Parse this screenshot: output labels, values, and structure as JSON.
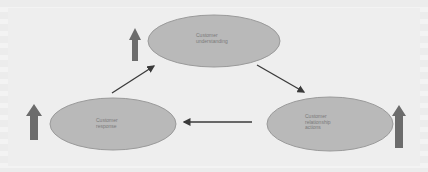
{
  "diagram": {
    "type": "cycle",
    "nodes": [
      {
        "id": "understanding",
        "label": "Customer\nunderstanding"
      },
      {
        "id": "response",
        "label": "Customer\nresponse"
      },
      {
        "id": "actions",
        "label": "Customer\nrelationship\nactions"
      }
    ],
    "edges": [
      {
        "from": "response",
        "to": "understanding"
      },
      {
        "from": "understanding",
        "to": "actions"
      },
      {
        "from": "actions",
        "to": "response"
      }
    ],
    "indicators": [
      {
        "node": "understanding",
        "icon": "up-arrow-icon"
      },
      {
        "node": "response",
        "icon": "up-arrow-icon"
      },
      {
        "node": "actions",
        "icon": "up-arrow-icon"
      }
    ],
    "colors": {
      "ellipse_fill": "#b9b9b9",
      "ellipse_stroke": "#9a9a9a",
      "up_arrow": "#6c6c6c",
      "connector": "#3a3a3a",
      "background": "#ededed"
    }
  }
}
